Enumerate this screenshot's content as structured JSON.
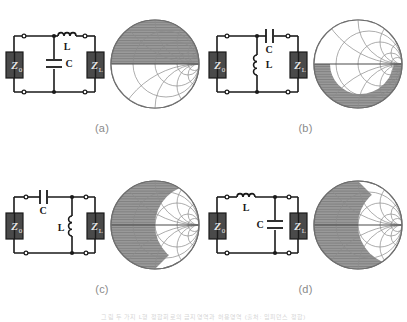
{
  "figure": {
    "title_fragment": "",
    "bottom_caption": "그림 두 가지 L형 정합회로의 금지영역과 허용영역 (출처: 임피던스 정합)",
    "colors": {
      "shade_gray": "#999999",
      "grid_gray": "#8c8c8c",
      "wire_black": "#1a1a1a",
      "block_fill": "#4a4a4a",
      "block_text": "#e8e8e8",
      "label_gray": "#8a8a8a",
      "chart_outline": "#6e6e6e",
      "background": "#ffffff"
    }
  },
  "panels": [
    {
      "id": "a",
      "label": "(a)",
      "source_label": "Z",
      "source_sub": "0",
      "load_label": "Z",
      "load_sub": "L",
      "topology": "shunt-C then series-L",
      "components": [
        {
          "name": "series-inductor",
          "type": "inductor",
          "label": "L",
          "position": "series-top"
        },
        {
          "name": "shunt-capacitor",
          "type": "capacitor",
          "label": "C",
          "position": "shunt-left"
        }
      ],
      "smith": {
        "shaded_region": "upper",
        "description": "forbidden region shaded upper portion with crescent clear area lower-left"
      }
    },
    {
      "id": "b",
      "label": "(b)",
      "source_label": "Z",
      "source_sub": "0",
      "load_label": "Z",
      "load_sub": "L",
      "topology": "shunt-L then series-C",
      "components": [
        {
          "name": "series-capacitor",
          "type": "capacitor",
          "label": "C",
          "position": "series-top"
        },
        {
          "name": "shunt-inductor",
          "type": "inductor",
          "label": "L",
          "position": "shunt-left"
        }
      ],
      "smith": {
        "shaded_region": "lower-right",
        "description": "forbidden region shaded lower-right with crescent clear area upper-left"
      }
    },
    {
      "id": "c",
      "label": "(c)",
      "source_label": "Z",
      "source_sub": "0",
      "load_label": "Z",
      "load_sub": "L",
      "topology": "series-C then shunt-L",
      "components": [
        {
          "name": "series-capacitor",
          "type": "capacitor",
          "label": "C",
          "position": "series-top"
        },
        {
          "name": "shunt-inductor",
          "type": "inductor",
          "label": "L",
          "position": "shunt-right"
        }
      ],
      "smith": {
        "shaded_region": "upper-left",
        "description": "forbidden region shaded upper-left with crescent clear area lower-right"
      }
    },
    {
      "id": "d",
      "label": "(d)",
      "source_label": "Z",
      "source_sub": "0",
      "load_label": "Z",
      "load_sub": "L",
      "topology": "series-L then shunt-C",
      "components": [
        {
          "name": "series-inductor",
          "type": "inductor",
          "label": "L",
          "position": "series-top"
        },
        {
          "name": "shunt-capacitor",
          "type": "capacitor",
          "label": "C",
          "position": "shunt-right"
        }
      ],
      "smith": {
        "shaded_region": "lower-left",
        "description": "forbidden region shaded lower-left with crescent clear area upper-right"
      }
    }
  ]
}
